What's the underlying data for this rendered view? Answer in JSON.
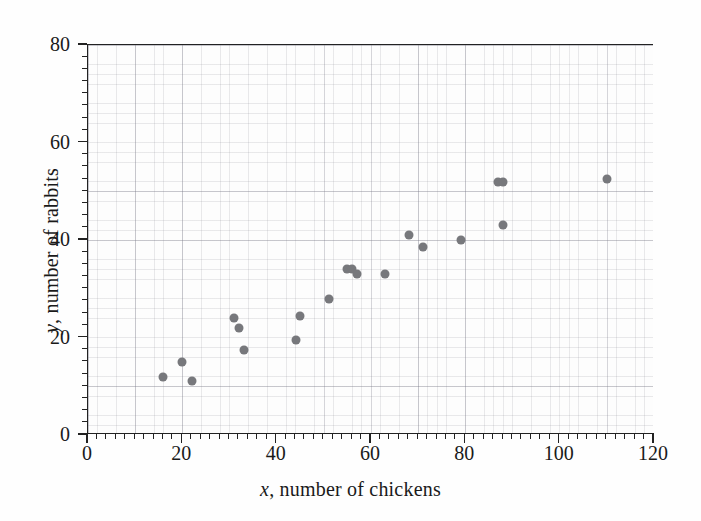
{
  "chart_data": {
    "type": "scatter",
    "title": "",
    "xlabel": "x, number of chickens",
    "ylabel": "y, number of rabbits",
    "xlim": [
      0,
      120
    ],
    "ylim": [
      0,
      80
    ],
    "xticks": [
      0,
      20,
      40,
      60,
      80,
      100,
      120
    ],
    "yticks": [
      0,
      20,
      40,
      60,
      80
    ],
    "xtick_labels": [
      "0",
      "20",
      "40",
      "60",
      "80",
      "100",
      "120"
    ],
    "ytick_labels": [
      "0",
      "20",
      "40",
      "60",
      "80"
    ],
    "x_minor_tick_step": 2,
    "y_minor_tick_step": 2.5,
    "grid": true,
    "grid_style": "fine graph-paper grid, minor and major",
    "legend": null,
    "marker": {
      "shape": "circle",
      "color": "#77787c",
      "size_px": 9
    },
    "points": [
      {
        "x": 16,
        "y": 12
      },
      {
        "x": 20,
        "y": 15
      },
      {
        "x": 22,
        "y": 11
      },
      {
        "x": 31,
        "y": 24
      },
      {
        "x": 32,
        "y": 22
      },
      {
        "x": 33,
        "y": 17.5
      },
      {
        "x": 44,
        "y": 19.5
      },
      {
        "x": 45,
        "y": 24.5
      },
      {
        "x": 51,
        "y": 28
      },
      {
        "x": 55,
        "y": 34
      },
      {
        "x": 56,
        "y": 34
      },
      {
        "x": 57,
        "y": 33
      },
      {
        "x": 63,
        "y": 33
      },
      {
        "x": 68,
        "y": 41
      },
      {
        "x": 71,
        "y": 38.5
      },
      {
        "x": 79,
        "y": 40
      },
      {
        "x": 87,
        "y": 52
      },
      {
        "x": 88,
        "y": 52
      },
      {
        "x": 88,
        "y": 43
      },
      {
        "x": 110,
        "y": 52.5
      }
    ]
  },
  "axes": {
    "x_title_prefix": "x",
    "x_title_rest": ", number of chickens",
    "y_title_prefix": "y",
    "y_title_rest": ", number of rabbits"
  }
}
